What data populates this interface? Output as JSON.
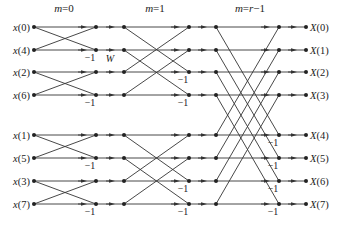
{
  "stage_labels": [
    "m=0",
    "m=1",
    "m=r−1"
  ],
  "inputs": [
    "x(0)",
    "x(4)",
    "x(2)",
    "x(6)",
    "x(1)",
    "x(5)",
    "x(3)",
    "x(7)"
  ],
  "outputs": [
    "X(0)",
    "X(1)",
    "X(2)",
    "X(3)",
    "X(4)",
    "X(5)",
    "X(6)",
    "X(7)"
  ],
  "minus_one": "−1",
  "twiddles": {
    "stage0": [
      {
        "row": 1,
        "exp": "0"
      },
      {
        "row": 3,
        "exp": "2"
      },
      {
        "row": 5,
        "exp": "1"
      },
      {
        "row": 7,
        "exp": "3"
      }
    ],
    "stage1": [
      {
        "row": 2,
        "exp": "0"
      },
      {
        "row": 3,
        "exp": "0"
      },
      {
        "row": 6,
        "exp": "2"
      },
      {
        "row": 7,
        "exp": "2"
      }
    ],
    "stage2": [
      {
        "row": 4,
        "exp": "0"
      },
      {
        "row": 5,
        "exp": "0"
      },
      {
        "row": 6,
        "exp": "0"
      },
      {
        "row": 7,
        "exp": "0"
      }
    ]
  },
  "twiddle_base": "W",
  "twiddle_sub": "8",
  "colors": {
    "line": "#333333",
    "text": "#222222"
  }
}
